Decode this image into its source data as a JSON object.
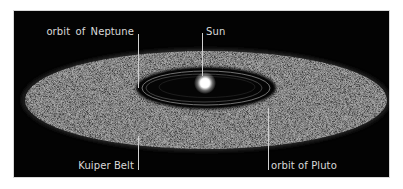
{
  "diagram": {
    "labels": {
      "neptune": "orbit of  Neptune",
      "sun": "Sun",
      "kuiper_belt": "Kuiper Belt",
      "pluto": "orbit of Pluto"
    },
    "colors": {
      "background": "#030303",
      "belt": "#4a4a4a",
      "inner_void": "#050505",
      "orbit_ring": "#8a8a8a",
      "sun_core": "#ffffff",
      "label_text": "#d9d9d9",
      "leader_line": "#cfcfcf",
      "frame": "#d8d8d8"
    }
  }
}
